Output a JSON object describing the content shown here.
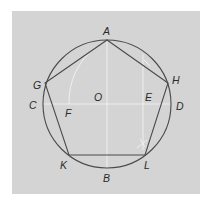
{
  "diagram": {
    "colors": {
      "background_panel": "#d4d4d4",
      "page": "#ffffff",
      "stroke": "#4a4a4a",
      "construction": "#f2f2f2",
      "label": "#2a2a2a"
    },
    "circle": {
      "center_label": "O",
      "cx": 107,
      "cy": 104,
      "r": 64
    },
    "points": {
      "A": {
        "label": "A",
        "x": 107,
        "y": 40
      },
      "B": {
        "label": "B",
        "x": 107,
        "y": 168
      },
      "C": {
        "label": "C",
        "x": 43,
        "y": 104
      },
      "D": {
        "label": "D",
        "x": 171,
        "y": 104
      },
      "E": {
        "label": "E",
        "x": 143,
        "y": 104
      },
      "F": {
        "label": "F",
        "x": 69,
        "y": 104
      },
      "G": {
        "label": "G",
        "x": 45,
        "y": 83
      },
      "H": {
        "label": "H",
        "x": 168,
        "y": 83
      },
      "K": {
        "label": "K",
        "x": 69,
        "y": 155
      },
      "L": {
        "label": "L",
        "x": 145,
        "y": 155
      },
      "O": {
        "label": "O",
        "x": 107,
        "y": 104
      }
    },
    "pentagon": [
      "A",
      "H",
      "L",
      "K",
      "G"
    ],
    "labels": [
      {
        "id": "A",
        "text": "A",
        "x": 103,
        "y": 35
      },
      {
        "id": "B",
        "text": "B",
        "x": 103,
        "y": 182
      },
      {
        "id": "C",
        "text": "C",
        "x": 29,
        "y": 109
      },
      {
        "id": "D",
        "text": "D",
        "x": 176,
        "y": 110
      },
      {
        "id": "E",
        "text": "E",
        "x": 145,
        "y": 101
      },
      {
        "id": "F",
        "text": "F",
        "x": 65,
        "y": 117
      },
      {
        "id": "G",
        "text": "G",
        "x": 33,
        "y": 89
      },
      {
        "id": "H",
        "text": "H",
        "x": 172,
        "y": 84
      },
      {
        "id": "K",
        "text": "K",
        "x": 60,
        "y": 169
      },
      {
        "id": "L",
        "text": "L",
        "x": 144,
        "y": 169
      },
      {
        "id": "O",
        "text": "O",
        "x": 94,
        "y": 101
      }
    ]
  }
}
